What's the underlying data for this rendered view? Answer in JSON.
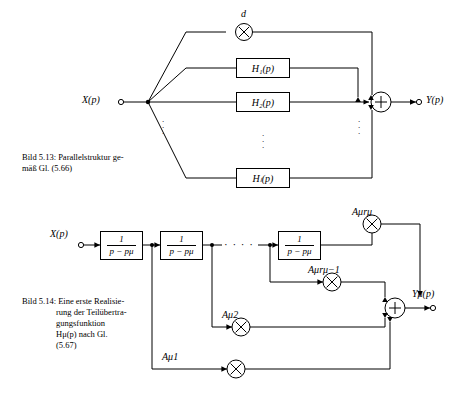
{
  "page": {
    "width": 462,
    "height": 395,
    "background": "#ffffff",
    "ink": "#000000"
  },
  "figure_513": {
    "caption_lines": [
      "Bild 5.13:  Parallelstruktur ge-",
      "mäß Gl. (5.66)"
    ],
    "input_label": "X(p)",
    "output_label": "Y(p)",
    "gain_label": "d",
    "blocks": [
      {
        "label": "H₁(p)"
      },
      {
        "label": "H₂(p)"
      },
      {
        "label": "Hₗ(p)"
      }
    ],
    "multiplier_symbol": "×",
    "adder_symbol": "+",
    "vertical_dots": "⋮"
  },
  "figure_514": {
    "caption_lines": [
      "Bild 5.14:  Eine erste Realisie-",
      "rung der Teilübertra-",
      "gungsfunktion",
      "Hμ(p) nach Gl.",
      "(5.67)"
    ],
    "input_label": "X(p)",
    "output_label": "Yμ(p)",
    "integrator_blocks": [
      {
        "num": "1",
        "den": "p − pμ"
      },
      {
        "num": "1",
        "den": "p − pμ"
      },
      {
        "num": "1",
        "den": "p − pμ"
      }
    ],
    "coefficients": [
      {
        "label": "Aμ1"
      },
      {
        "label": "Aμ2"
      },
      {
        "label": "Aμrμ−1"
      },
      {
        "label": "Aμrμ"
      }
    ],
    "multiplier_symbol": "×",
    "adder_symbol": "+",
    "horizontal_dots": "· · · ·"
  }
}
